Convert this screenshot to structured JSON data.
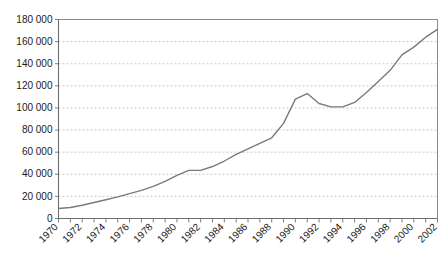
{
  "chart_data": {
    "type": "line",
    "title": "",
    "subtitle": "",
    "xlabel": "",
    "ylabel": "",
    "grid": true,
    "legend": null,
    "legend_position": "none",
    "line_color": "#7a7a7a",
    "axis_color": "#6e6e6e",
    "grid_color": "#c9a9a9",
    "xlim": [
      1970,
      2002
    ],
    "ylim": [
      0,
      180000
    ],
    "ytick_values": [
      0,
      20000,
      40000,
      60000,
      80000,
      100000,
      120000,
      140000,
      160000,
      180000
    ],
    "ytick_labels": [
      "0",
      "20 000",
      "40 000",
      "60 000",
      "80 000",
      "100 000",
      "120 000",
      "140 000",
      "160 000",
      "180 000"
    ],
    "xtick_values": [
      1970,
      1971,
      1972,
      1973,
      1974,
      1975,
      1976,
      1977,
      1978,
      1979,
      1980,
      1981,
      1982,
      1983,
      1984,
      1985,
      1986,
      1987,
      1988,
      1989,
      1990,
      1991,
      1992,
      1993,
      1994,
      1995,
      1996,
      1997,
      1998,
      1999,
      2000,
      2001,
      2002
    ],
    "xtick_labels": [
      "1970",
      "",
      "1972",
      "",
      "1974",
      "",
      "1976",
      "",
      "1978",
      "",
      "1980",
      "",
      "1982",
      "",
      "1984",
      "",
      "1986",
      "",
      "1988",
      "",
      "1990",
      "",
      "1992",
      "",
      "1994",
      "",
      "1996",
      "",
      "1998",
      "",
      "2000",
      "",
      "2002"
    ],
    "x": [
      1970,
      1971,
      1972,
      1973,
      1974,
      1975,
      1976,
      1977,
      1978,
      1979,
      1980,
      1981,
      1982,
      1983,
      1984,
      1985,
      1986,
      1987,
      1988,
      1989,
      1990,
      1991,
      1992,
      1993,
      1994,
      1995,
      1996,
      1997,
      1998,
      1999,
      2000,
      2001,
      2002
    ],
    "values": [
      9000,
      10000,
      12000,
      14500,
      17000,
      19500,
      22500,
      25500,
      29000,
      33500,
      39000,
      43500,
      43500,
      47000,
      52000,
      58000,
      63000,
      68000,
      73000,
      86000,
      108000,
      113000,
      104000,
      101000,
      101000,
      105000,
      114000,
      124000,
      134000,
      148000,
      155000,
      164000,
      171000
    ]
  }
}
